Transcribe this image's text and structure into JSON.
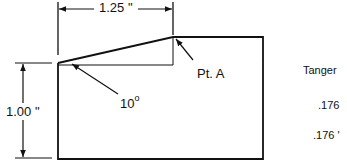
{
  "diagram": {
    "width_dimension": "1.25 \"",
    "height_dimension": "1.00 \"",
    "angle_label": "10",
    "angle_unit": "o",
    "point_label": "Pt. A",
    "right_panel": {
      "heading": "Tanger",
      "values": [
        ".176",
        ".176 '"
      ]
    },
    "colors": {
      "line": "#111111",
      "background": "#ffffff"
    }
  }
}
